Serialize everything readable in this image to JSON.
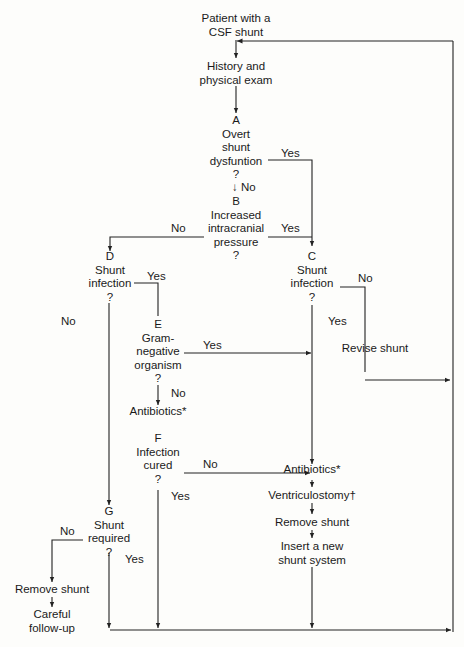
{
  "diagram": {
    "type": "flowchart",
    "title": "Patient with a CSF shunt",
    "nodes": {
      "start": {
        "lines": [
          "Patient with a",
          "CSF shunt"
        ]
      },
      "history": {
        "lines": [
          "History and",
          "physical exam"
        ]
      },
      "A": {
        "lines": [
          "A",
          "Overt",
          "shunt",
          "dysfuntion",
          "?"
        ]
      },
      "B": {
        "lines": [
          "B",
          "Increased",
          "intracranial",
          "pressure",
          "?"
        ]
      },
      "C": {
        "lines": [
          "C",
          "Shunt",
          "infection",
          "?"
        ]
      },
      "D": {
        "lines": [
          "D",
          "Shunt",
          "infection",
          "?"
        ]
      },
      "E": {
        "lines": [
          "E",
          "Gram-",
          "negative",
          "organism",
          "?"
        ]
      },
      "antibiotics_e": {
        "lines": [
          "Antibiotics*"
        ]
      },
      "F": {
        "lines": [
          "F",
          "Infection",
          "cured",
          "?"
        ]
      },
      "G": {
        "lines": [
          "G",
          "Shunt",
          "required",
          "?"
        ]
      },
      "revise": {
        "lines": [
          "Revise shunt"
        ]
      },
      "antibiotics_c": {
        "lines": [
          "Antibiotics*"
        ]
      },
      "ventriculostomy": {
        "lines": [
          "Ventriculostomy†"
        ]
      },
      "remove_c": {
        "lines": [
          "Remove shunt"
        ]
      },
      "insert": {
        "lines": [
          "Insert a new",
          "shunt system"
        ]
      },
      "remove_g": {
        "lines": [
          "Remove shunt"
        ]
      },
      "followup": {
        "lines": [
          "Careful",
          "follow-up"
        ]
      }
    },
    "edge_labels": {
      "a_no": "↓  No",
      "a_yes": "Yes",
      "b_no": "No",
      "b_yes": "Yes",
      "d_yes": "Yes",
      "d_no": "No",
      "c_no": "No",
      "c_yes": "Yes",
      "e_yes": "Yes",
      "e_no": "No",
      "f_no": "No",
      "f_yes": "Yes",
      "g_no": "No",
      "g_yes": "Yes"
    }
  }
}
